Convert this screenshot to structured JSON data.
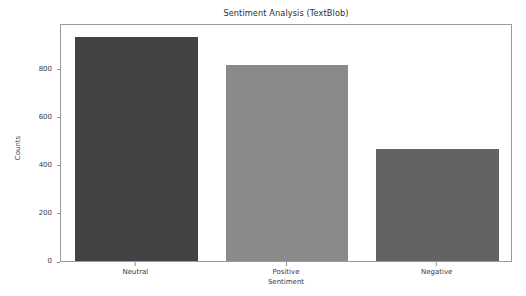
{
  "chart_data": {
    "type": "bar",
    "title": "Sentiment Analysis (TextBlob)",
    "xlabel": "Sentiment",
    "ylabel": "Counts",
    "categories": [
      "Neutral",
      "Positive",
      "Negative"
    ],
    "values": [
      933,
      817,
      467
    ],
    "bar_colors": [
      "#434343",
      "#8a8a8a",
      "#636363"
    ],
    "ylim": [
      0,
      990
    ],
    "yticks": [
      0,
      200,
      400,
      600,
      800
    ],
    "ytick_labels": [
      "0",
      "200",
      "400",
      "600",
      "800"
    ],
    "grid": false,
    "legend": null,
    "frame_color": "#9a9a9a",
    "background": "#ffffff"
  }
}
